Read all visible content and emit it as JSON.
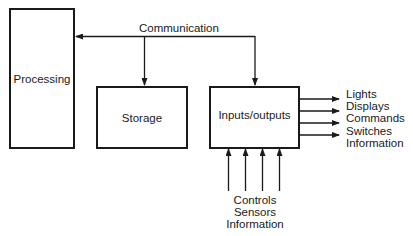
{
  "diagram": {
    "nodes": {
      "processing": {
        "label": "Processing"
      },
      "storage": {
        "label": "Storage"
      },
      "io": {
        "label": "Inputs/outputs"
      }
    },
    "bus": {
      "label": "Communication"
    },
    "outputs": [
      "Lights",
      "Displays",
      "Commands",
      "Switches",
      "Information"
    ],
    "inputs": [
      "Controls",
      "Sensors",
      "Information"
    ],
    "edges": [
      {
        "from": "bus",
        "to": "processing"
      },
      {
        "from": "bus",
        "to": "storage"
      },
      {
        "from": "bus",
        "to": "io"
      },
      {
        "from": "io",
        "to": "outputs",
        "count": 4
      },
      {
        "from": "inputs",
        "to": "io",
        "count": 4
      }
    ],
    "colors": {
      "line": "#1a1a1a",
      "background": "#ffffff"
    }
  }
}
